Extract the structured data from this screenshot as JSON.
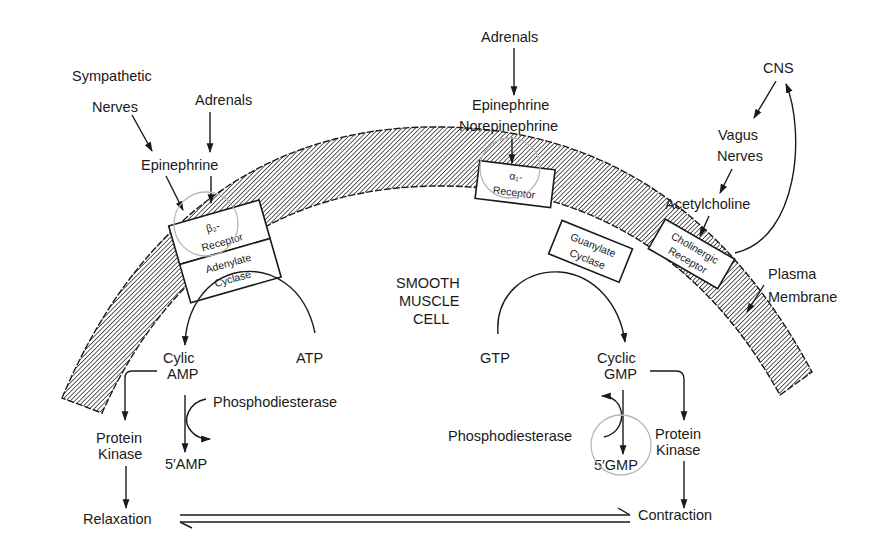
{
  "diagram": {
    "colors": {
      "ink": "#1a1a1a",
      "background": "#ffffff",
      "annotation_circle": "#b8b8b8"
    },
    "cell_label": [
      "SMOOTH",
      "MUSCLE",
      "CELL"
    ],
    "membrane_label": [
      "Plasma",
      "Membrane"
    ],
    "left_pathway": {
      "sources": {
        "sympathetic": [
          "Sympathetic",
          "Nerves"
        ],
        "adrenals": "Adrenals"
      },
      "ligand": "Epinephrine",
      "receptor": {
        "symbol": "β₂-",
        "label": "Receptor"
      },
      "enzyme": [
        "Adenylate",
        "Cyclase"
      ],
      "substrate": "ATP",
      "product": [
        "Cylic",
        "AMP"
      ],
      "degrading_enzyme": "Phosphodiesterase",
      "degraded_product": "5′AMP",
      "kinase": [
        "Protein",
        "Kinase"
      ],
      "effect": "Relaxation"
    },
    "middle_pathway": {
      "source": "Adrenals",
      "ligands": [
        "Epinephrine",
        "Norepinephrine"
      ],
      "receptor": {
        "symbol": "α₁-",
        "label": "Receptor"
      }
    },
    "right_pathway": {
      "source": "CNS",
      "nerves": [
        "Vagus",
        "Nerves"
      ],
      "ligand": "Acetylcholine",
      "receptor": [
        "Cholinergic",
        "Receptor"
      ],
      "enzyme": [
        "Guanylate",
        "Cyclase"
      ],
      "substrate": "GTP",
      "product": [
        "Cyclic",
        "GMP"
      ],
      "degrading_enzyme": "Phosphodiesterase",
      "degraded_product": "5′GMP",
      "kinase": [
        "Protein",
        "Kinase"
      ],
      "effect": "Contraction"
    },
    "equilibrium": "Relaxation ⇌ Contraction"
  }
}
